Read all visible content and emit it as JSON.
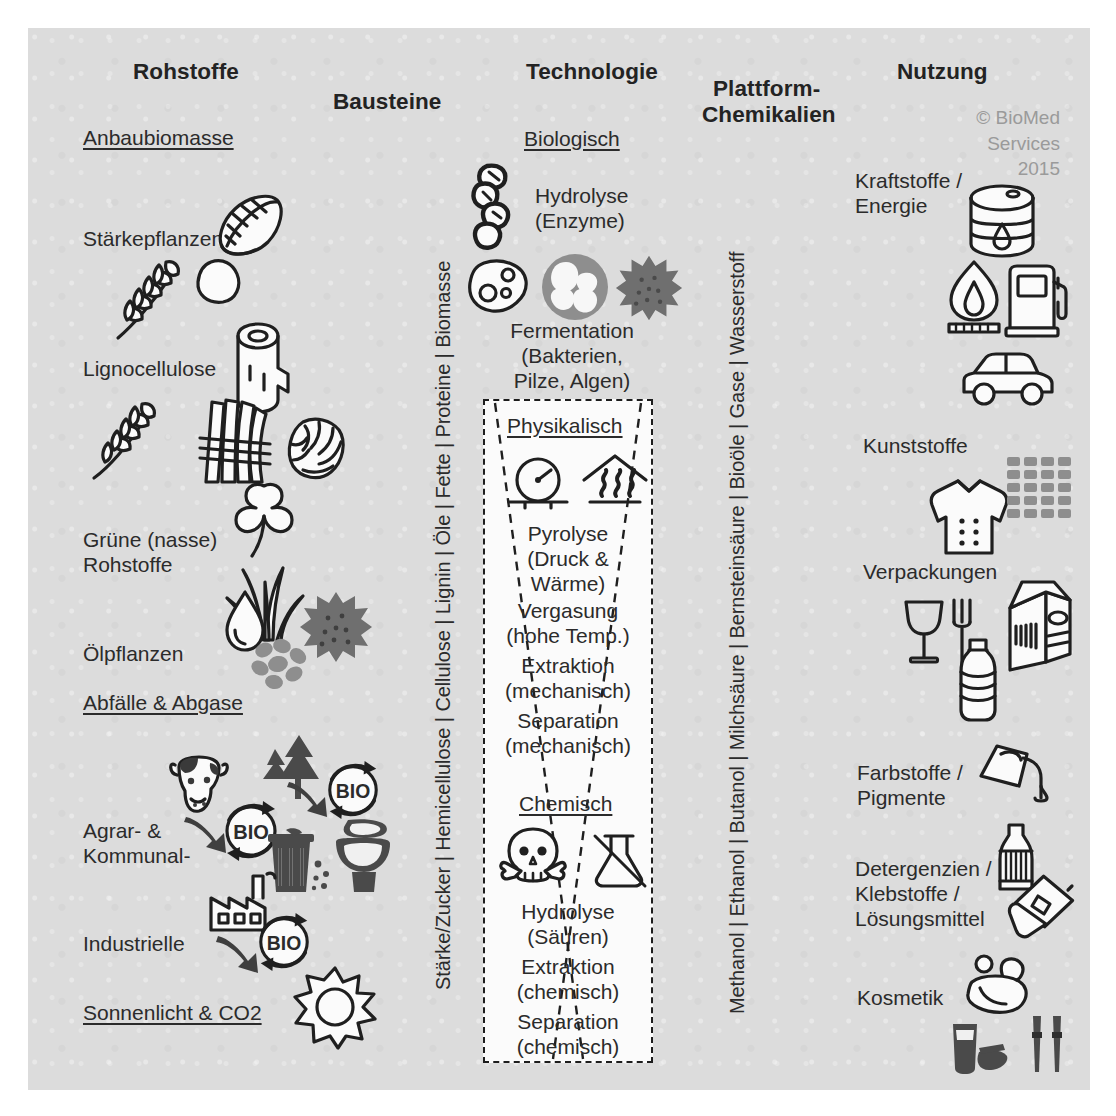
{
  "diagram": {
    "copyright": {
      "line1": "© BioMed",
      "line2": "Services",
      "line3": "2015"
    },
    "columns": {
      "rohstoffe": {
        "header": "Rohstoffe",
        "groups": [
          {
            "title": "Anbaubiomasse",
            "items": [
              {
                "label": "Stärkepflanzen",
                "icons": [
                  "corn-cob-icon",
                  "wheat-ear-icon",
                  "potato-icon"
                ]
              },
              {
                "label": "Lignocellulose",
                "icons": [
                  "wood-log-icon",
                  "wheat-stalk-icon",
                  "straw-bundle-icon",
                  "hop-cone-icon"
                ]
              },
              {
                "label": "Grüne (nasse)\nRohstoffe",
                "icons": [
                  "clover-icon",
                  "grass-icon"
                ]
              },
              {
                "label": "Ölpflanzen",
                "icons": [
                  "oil-drop-icon",
                  "seeds-icon",
                  "sunflower-seed-burst-icon"
                ]
              }
            ]
          },
          {
            "title": "Abfälle & Abgase",
            "items": [
              {
                "label": "Agrar- &\nKommunal-",
                "icons": [
                  "cow-icon",
                  "bio-cycle-icon",
                  "tree-icon",
                  "trash-can-icon",
                  "toilet-icon"
                ]
              },
              {
                "label": "Industrielle",
                "icons": [
                  "factory-icon",
                  "bio-cycle-icon"
                ]
              }
            ]
          },
          {
            "title": "Sonnenlicht & CO2",
            "items": [
              {
                "label": "",
                "icons": [
                  "sun-icon"
                ]
              }
            ]
          }
        ]
      },
      "bausteine": {
        "header": "Bausteine",
        "vertical_list": "Stärke/Zucker | Hemicellulose | Cellulose | Lignin | Öle | Fette | Proteine | Biomasse"
      },
      "technologie": {
        "header": "Technologie",
        "sections": [
          {
            "title": "Biologisch",
            "entries": [
              {
                "label": "Hydrolyse\n(Enzyme)",
                "icons": [
                  "enzyme-chain-icon"
                ]
              },
              {
                "label": "Fermentation\n(Bakterien,\nPilze, Algen)",
                "icons": [
                  "bacterium-icon",
                  "yeast-cell-icon",
                  "algae-burst-icon"
                ]
              }
            ]
          },
          {
            "title": "Physikalisch",
            "entries": [
              {
                "label": "Pyrolyse\n(Druck &\nWärme)",
                "icons": [
                  "pressure-gauge-icon",
                  "heat-oven-icon"
                ]
              },
              {
                "label": "Vergasung\n(hohe Temp.)",
                "icons": []
              },
              {
                "label": "Extraktion\n(mechanisch)",
                "icons": []
              },
              {
                "label": "Separation\n(mechanisch)",
                "icons": []
              }
            ]
          },
          {
            "title": "Chemisch",
            "entries": [
              {
                "label": "Hydrolyse\n(Säuren)",
                "icons": [
                  "skull-poison-icon",
                  "flask-crossed-out-icon"
                ]
              },
              {
                "label": "Extraktion\n(chemisch)",
                "icons": []
              },
              {
                "label": "Separation\n(chemisch)",
                "icons": []
              }
            ]
          }
        ]
      },
      "plattform": {
        "header_line1": "Plattform-",
        "header_line2": "Chemikalien",
        "vertical_list": "Methanol | Ethanol | Butanol | Milchsäure | Bernsteinsäure | Bioöle | Gase | Wasserstoff"
      },
      "nutzung": {
        "header": "Nutzung",
        "items": [
          {
            "label": "Kraftstoffe /\nEnergie",
            "icons": [
              "oil-barrel-icon",
              "flame-burner-icon",
              "fuel-pump-icon",
              "car-icon"
            ]
          },
          {
            "label": "Kunststoffe",
            "icons": [
              "shirt-icon",
              "plastic-granulate-icon"
            ]
          },
          {
            "label": "Verpackungen",
            "icons": [
              "food-safe-glass-fork-icon",
              "milk-carton-icon",
              "plastic-bottle-icon"
            ]
          },
          {
            "label": "Farbstoffe /\nPigmente",
            "icons": [
              "paint-can-icon"
            ]
          },
          {
            "label": "Detergenzien /\nKlebstoffe /\nLösungsmittel",
            "icons": [
              "detergent-bottle-icon",
              "glue-stick-icon"
            ]
          },
          {
            "label": "Kosmetik",
            "icons": [
              "soap-foam-icon",
              "cream-tube-icon",
              "mascara-icon"
            ]
          }
        ]
      }
    },
    "colors": {
      "panel_bg": "#dcdcdc",
      "ink": "#2b2b2b",
      "icon_stroke": "#1f1f1f",
      "accent_gray": "#8e8e8e",
      "watermark": "#9a9a9a"
    }
  }
}
